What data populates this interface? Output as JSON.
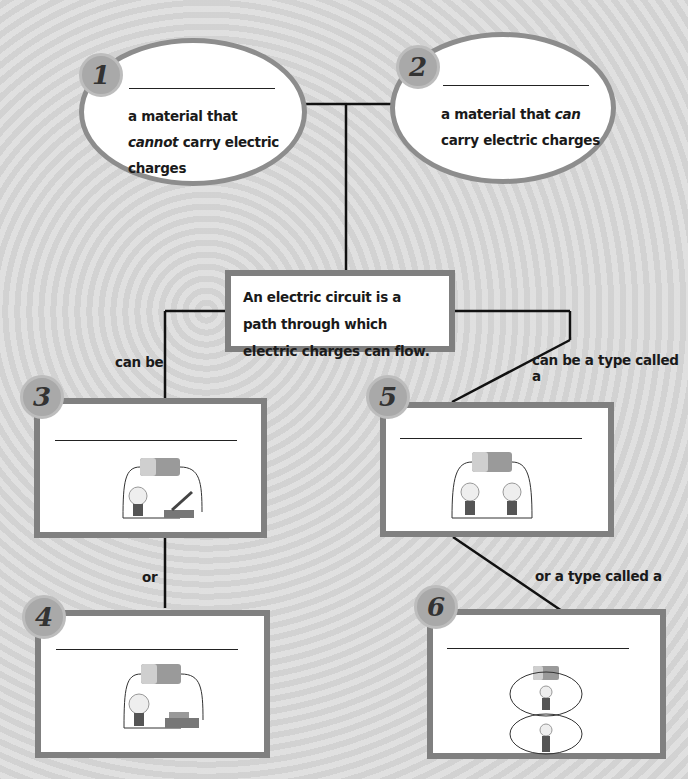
{
  "diagram": {
    "center": {
      "text": "An electric circuit is a path through which electric charges can flow."
    },
    "nodes": [
      {
        "number": "1",
        "shape": "oval",
        "blank": "",
        "definition_parts": [
          "a material that ",
          "cannot",
          " carry electric charges"
        ]
      },
      {
        "number": "2",
        "shape": "oval",
        "blank": "",
        "definition_parts": [
          "a material that ",
          "can",
          " carry electric charges"
        ]
      },
      {
        "number": "3",
        "shape": "box",
        "blank": "",
        "image": "open-circuit-with-switch-open"
      },
      {
        "number": "4",
        "shape": "box",
        "blank": "",
        "image": "closed-circuit-with-switch-closed"
      },
      {
        "number": "5",
        "shape": "box",
        "blank": "",
        "image": "series-circuit-two-bulbs"
      },
      {
        "number": "6",
        "shape": "box",
        "blank": "",
        "image": "parallel-circuit-two-bulbs"
      }
    ],
    "connectors": {
      "can_be": "can be",
      "or": "or",
      "can_be_type": "can be a type called a",
      "or_type": "or a type called a"
    }
  }
}
